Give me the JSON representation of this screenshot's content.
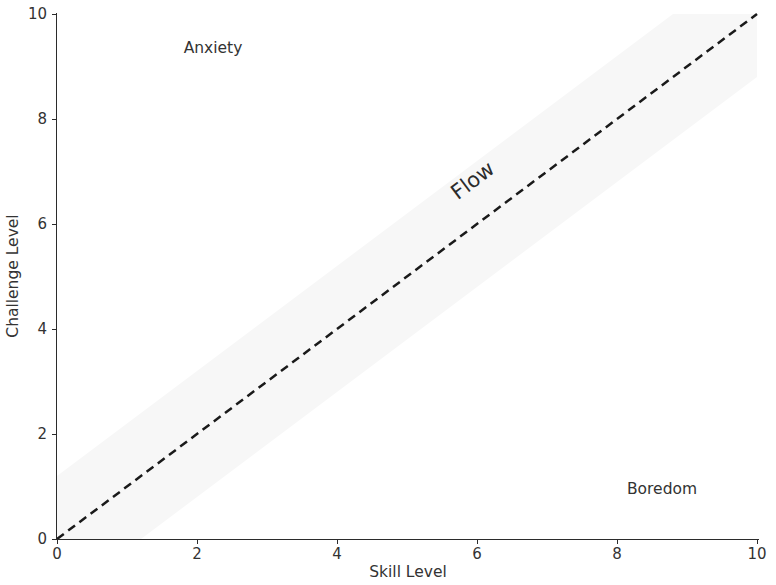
{
  "chart_data": {
    "type": "line",
    "title": "",
    "xlabel": "Skill Level",
    "ylabel": "Challenge Level",
    "xlim": [
      0,
      10
    ],
    "ylim": [
      0,
      10
    ],
    "xticks": [
      "0",
      "2",
      "4",
      "6",
      "8",
      "10"
    ],
    "yticks": [
      "0",
      "2",
      "4",
      "6",
      "8",
      "10"
    ],
    "xtick_values": [
      0,
      2,
      4,
      6,
      8,
      10
    ],
    "ytick_values": [
      0,
      2,
      4,
      6,
      8,
      10
    ],
    "grid": false,
    "legend": "none",
    "series": [
      {
        "name": "flow-line",
        "style": "dashed",
        "color": "#1a1a1a",
        "linewidth": 2.5,
        "x": [
          0,
          10
        ],
        "y": [
          0,
          10
        ]
      }
    ],
    "bands": [
      {
        "name": "flow-channel",
        "color": "#f7f7f7",
        "description": "faint shaded band of width +/-1.2 units around the y = x diagonal",
        "lower_offset": -1.2,
        "upper_offset": 1.2
      }
    ],
    "annotations": [
      {
        "name": "anxiety",
        "text": "Anxiety",
        "x": 2.23,
        "y": 9.33,
        "rotation": 0,
        "fontsize": 15.5
      },
      {
        "name": "flow",
        "text": "Flow",
        "x": 5.94,
        "y": 6.82,
        "rotation": -37,
        "fontsize": 21
      },
      {
        "name": "boredom",
        "text": "Boredom",
        "x": 8.64,
        "y": 0.93,
        "rotation": 0,
        "fontsize": 15.5
      }
    ]
  },
  "axes": {
    "xlabel": "Skill Level",
    "ylabel": "Challenge Level"
  },
  "annotations": {
    "anxiety": "Anxiety",
    "flow": "Flow",
    "boredom": "Boredom"
  },
  "colors": {
    "line": "#1a1a1a",
    "band": "#f7f7f7",
    "text": "#333333",
    "spine": "#2b2b2b",
    "background": "#ffffff"
  }
}
